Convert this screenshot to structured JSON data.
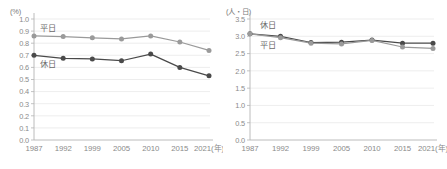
{
  "figure": {
    "background": "#ffffff",
    "series_colors": {
      "weekday": "#9a9a9a",
      "holiday": "#4a4a4a"
    },
    "axis_color": "#b4b4b4",
    "grid_color": "#e8e8e8",
    "tick_text_color": "#8a8a8a",
    "caption": ""
  },
  "chart_data": [
    {
      "id": "left",
      "type": "line",
      "title": "",
      "xlabel": "年",
      "ylabel": "(%)",
      "unit_label": "(%)",
      "x_unit_suffix": "(年)",
      "categories": [
        "1987",
        "1992",
        "1999",
        "2005",
        "2010",
        "2015",
        "2021"
      ],
      "last_category_label": "2021(年)",
      "ylim": [
        0.0,
        1.0
      ],
      "ytick_step": 0.1,
      "ytick_labels": [
        "0.0",
        "0.1",
        "0.2",
        "0.3",
        "0.4",
        "0.5",
        "0.6",
        "0.7",
        "0.8",
        "0.9",
        "1.0"
      ],
      "grid": true,
      "legend_position": "inline-annotation",
      "series": [
        {
          "name": "平日",
          "color": "#9a9a9a",
          "annotation": "平日",
          "values": [
            0.86,
            0.855,
            0.845,
            0.835,
            0.86,
            0.81,
            0.74
          ]
        },
        {
          "name": "休日",
          "color": "#4a4a4a",
          "annotation": "休日",
          "values": [
            0.7,
            0.675,
            0.67,
            0.655,
            0.71,
            0.6,
            0.53
          ]
        }
      ]
    },
    {
      "id": "right",
      "type": "line",
      "title": "",
      "xlabel": "年",
      "ylabel": "(人・日)",
      "unit_label": "(人・日)",
      "x_unit_suffix": "(年)",
      "categories": [
        "1987",
        "1992",
        "1999",
        "2005",
        "2010",
        "2015",
        "2021"
      ],
      "last_category_label": "2021(年)",
      "ylim": [
        0.0,
        3.5
      ],
      "ytick_step": 0.5,
      "ytick_labels": [
        "0.0",
        "0.5",
        "1.0",
        "1.5",
        "2.0",
        "2.5",
        "3.0",
        "3.5"
      ],
      "grid": true,
      "legend_position": "inline-annotation",
      "series": [
        {
          "name": "休日",
          "color": "#4a4a4a",
          "annotation": "休日",
          "values": [
            3.07,
            3.0,
            2.82,
            2.83,
            2.89,
            2.8,
            2.8
          ]
        },
        {
          "name": "平日",
          "color": "#9a9a9a",
          "annotation": "平日",
          "values": [
            3.07,
            2.96,
            2.8,
            2.78,
            2.88,
            2.69,
            2.65
          ]
        }
      ]
    }
  ]
}
